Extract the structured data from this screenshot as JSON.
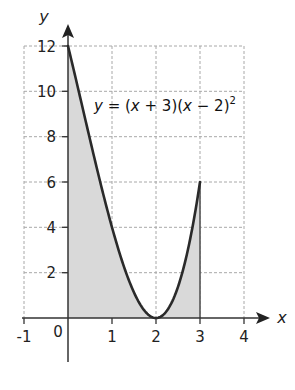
{
  "chart_data": {
    "type": "line",
    "title": "",
    "xlabel": "x",
    "ylabel": "y",
    "xlim": [
      -1,
      4
    ],
    "ylim": [
      0,
      12
    ],
    "grid": true,
    "x_ticks": [
      "-1",
      "1",
      "2",
      "3",
      "4"
    ],
    "y_ticks": [
      "2",
      "4",
      "6",
      "8",
      "10",
      "12"
    ],
    "origin_label": "0",
    "series": [
      {
        "name": "y = (x + 3)(x - 2)^2",
        "function": "(x+3)*(x-2)^2",
        "domain": [
          0,
          3
        ],
        "x": [
          0,
          0.5,
          1,
          1.5,
          2,
          2.5,
          3
        ],
        "values": [
          12,
          7.875,
          4,
          1.125,
          0,
          1.375,
          6
        ]
      }
    ],
    "shaded_region": {
      "from_x": 0,
      "to_x": 3,
      "under": "curve",
      "color": "#d9d9d9"
    },
    "annotations": [
      {
        "text": "y = (x + 3)(x − 2)²",
        "x": 1.0,
        "y": 9.6
      }
    ]
  },
  "labels": {
    "x_axis": "x",
    "y_axis": "y",
    "origin": "0",
    "eq_y": "y",
    "eq_mid": " = (",
    "eq_x1": "x",
    "eq_p1": " + 3)(",
    "eq_x2": "x",
    "eq_p2": " − 2)",
    "eq_sup": "2",
    "x_tick_m1": "-1",
    "x_tick_1": "1",
    "x_tick_2": "2",
    "x_tick_3": "3",
    "x_tick_4": "4",
    "y_tick_2": "2",
    "y_tick_4": "4",
    "y_tick_6": "6",
    "y_tick_8": "8",
    "y_tick_10": "10",
    "y_tick_12": "12"
  },
  "colors": {
    "curve": "#2a2a2a",
    "shade": "#d9d9d9",
    "grid": "#9a9a9a",
    "axis": "#333333"
  }
}
